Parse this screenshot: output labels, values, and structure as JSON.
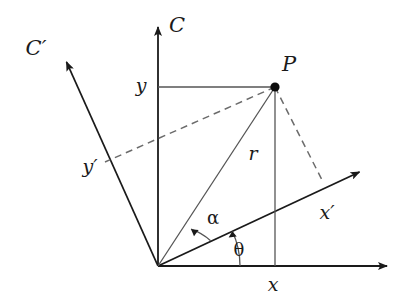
{
  "figure": {
    "kind": "geometry-diagram",
    "title_visible": false,
    "background_color": "#ffffff",
    "stroke_color": "#1a1a1a",
    "thin_stroke_color": "#4a4a4a",
    "dashed_stroke_color": "#6b6b6b",
    "width": 414,
    "height": 301
  },
  "geometry": {
    "origin": {
      "x": 158,
      "y": 266
    },
    "point_p": {
      "x": 275,
      "y": 87
    },
    "axis_c_tip": {
      "x": 158,
      "y": 20
    },
    "axis_x_tip": {
      "x": 396,
      "y": 266
    },
    "axis_cprime_tip": {
      "x": 62,
      "y": 53
    },
    "axis_xprime_tip": {
      "x": 368,
      "y": 168
    },
    "foot_on_xprime": {
      "x": 322,
      "y": 180
    },
    "foot_on_cprime": {
      "x": 105,
      "y": 162
    },
    "theta_degrees": 25,
    "alpha_degrees": 32,
    "theta_arc_radius": 82,
    "alpha_arc_radius": 58
  },
  "labels": {
    "axis_c": {
      "text": "C",
      "x": 177,
      "y": 25
    },
    "axis_c_prime": {
      "text": "C′",
      "x": 36,
      "y": 48
    },
    "axis_x_prime": {
      "text": "x′",
      "x": 327,
      "y": 212
    },
    "axis_y_prime": {
      "text": "y′",
      "x": 90,
      "y": 166
    },
    "point_p": {
      "text": "P",
      "x": 289,
      "y": 64
    },
    "coord_y": {
      "text": "y",
      "x": 141,
      "y": 85
    },
    "coord_x": {
      "text": "x",
      "x": 273,
      "y": 284
    },
    "radius_r": {
      "text": "r",
      "x": 253,
      "y": 153
    },
    "angle_alpha": {
      "text": "α",
      "x": 213,
      "y": 218
    },
    "angle_theta": {
      "text": "θ",
      "x": 239,
      "y": 250
    }
  }
}
